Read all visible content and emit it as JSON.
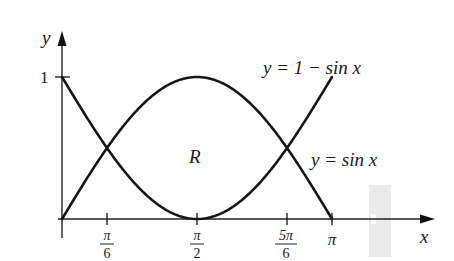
{
  "chart_data": {
    "type": "line",
    "title": "",
    "xlabel": "x",
    "ylabel": "y",
    "xlim": [
      0,
      3.14159
    ],
    "ylim": [
      0,
      1
    ],
    "grid": false,
    "legend": "none (curves labeled inline)",
    "x_ticks": [
      {
        "value": 0.5236,
        "label_num": "π",
        "label_den": "6"
      },
      {
        "value": 1.5708,
        "label_num": "π",
        "label_den": "2"
      },
      {
        "value": 2.618,
        "label_num": "5π",
        "label_den": "6"
      },
      {
        "value": 3.14159,
        "label": "π"
      }
    ],
    "y_ticks": [
      {
        "value": 1,
        "label": "1"
      }
    ],
    "series": [
      {
        "name": "y = sin x",
        "x": [
          0,
          0.5236,
          1.0472,
          1.5708,
          2.0944,
          2.618,
          3.14159
        ],
        "values": [
          0,
          0.5,
          0.866,
          1,
          0.866,
          0.5,
          0
        ]
      },
      {
        "name": "y = 1 − sin x",
        "x": [
          0,
          0.5236,
          1.0472,
          1.5708,
          2.0944,
          2.618,
          3.14159
        ],
        "values": [
          1,
          0.5,
          0.134,
          0,
          0.134,
          0.5,
          1
        ]
      }
    ],
    "annotations": [
      {
        "text": "R",
        "x": 1.5708,
        "y": 0.42,
        "note": "region between curves, π/6 ≤ x ≤ 5π/6"
      },
      {
        "text": "y = 1 − sin x",
        "near": "upper right end of curve 1 − sin x"
      },
      {
        "text": "y = sin x",
        "near": "right side of curve sin x"
      }
    ],
    "intersections": [
      {
        "x": 0.5236,
        "y": 0.5
      },
      {
        "x": 2.618,
        "y": 0.5
      }
    ]
  },
  "labels": {
    "y_axis": "y",
    "x_axis": "x",
    "y_tick_1": "1",
    "curve_upper_label": "y = 1 − sin x",
    "curve_lower_label": "y = sin x",
    "region": "R",
    "tick_pi6_num": "π",
    "tick_pi6_den": "6",
    "tick_pi2_num": "π",
    "tick_pi2_den": "2",
    "tick_5pi6_num": "5π",
    "tick_5pi6_den": "6",
    "tick_pi": "π"
  },
  "style": {
    "curve_color": "#151515",
    "axis_color": "#222222",
    "background": "#ffffff"
  }
}
